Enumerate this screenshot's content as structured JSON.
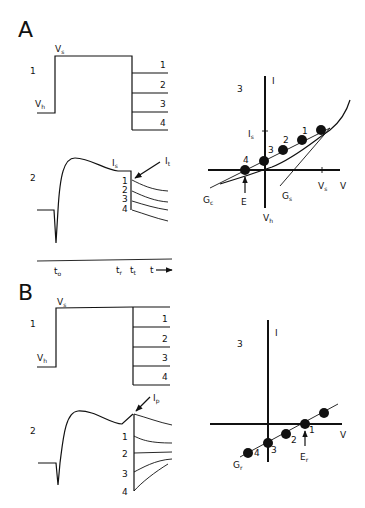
{
  "panels": [
    {
      "label": "A",
      "voltage_trace": {
        "row_label": "1",
        "levels": {
          "step": "V",
          "step_sub": "s",
          "hold": "V",
          "hold_sub": "h"
        },
        "repolarization_steps": [
          "1",
          "2",
          "3",
          "4"
        ]
      },
      "current_trace": {
        "row_label": "2",
        "steady_label": "I",
        "steady_sub": "s",
        "tail_label": "I",
        "tail_sub": "t",
        "tail_numbers": [
          "1",
          "2",
          "3",
          "4"
        ]
      },
      "time_axis": {
        "t0": "t",
        "t0_sub": "o",
        "tr": "t",
        "tr_sub": "r",
        "tt": "t",
        "tt_sub": "t",
        "t": "t"
      },
      "iv_plot": {
        "row_label": "3",
        "y_axis": "I",
        "x_axis": "V",
        "is_label": "I",
        "is_sub": "s",
        "vs_label": "V",
        "vs_sub": "s",
        "vh_label": "V",
        "vh_sub": "h",
        "reversal": "E",
        "gc_label": "G",
        "gc_sub": "c",
        "gs_label": "G",
        "gs_sub": "s",
        "points": [
          "1",
          "2",
          "3",
          "4"
        ]
      }
    },
    {
      "label": "B",
      "voltage_trace": {
        "row_label": "1",
        "levels": {
          "step": "V",
          "step_sub": "s",
          "hold": "V",
          "hold_sub": "h"
        },
        "repolarization_steps": [
          "1",
          "2",
          "3",
          "4"
        ]
      },
      "current_trace": {
        "row_label": "2",
        "peak_label": "I",
        "peak_sub": "p",
        "tail_numbers": [
          "1",
          "2",
          "3",
          "4"
        ]
      },
      "iv_plot": {
        "row_label": "3",
        "y_axis": "I",
        "x_axis": "V",
        "reversal": "E",
        "reversal_sub": "r",
        "gr_label": "G",
        "gr_sub": "r",
        "points": [
          "1",
          "2",
          "3",
          "4"
        ]
      }
    }
  ]
}
